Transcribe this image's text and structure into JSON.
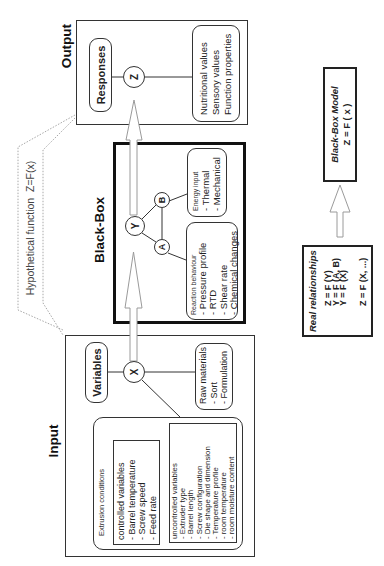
{
  "hypothetical_function": "Hypothetical function  Z=F(x)",
  "input": {
    "title": "Input",
    "variables_label": "Variables",
    "node": "X",
    "extrusion": {
      "title": "Extrusion conditions",
      "controlled": [
        "controlled variables",
        "- Barrel temperature",
        "- Screw speed",
        "- Feed rate"
      ],
      "uncontrolled": [
        "uncontrolled variables",
        "- Extruder type",
        "- Barrel length",
        "- Screw configuration",
        "- Die shape and dimension",
        "- Temperature profile",
        "- room temperature",
        "- room moisture content"
      ]
    },
    "raw_materials": [
      "Raw materials",
      "- Sort",
      "- Formulation"
    ]
  },
  "black_box": {
    "title": "Black-Box",
    "nodes": {
      "y": "Y",
      "a": "A",
      "b": "B"
    },
    "reaction": {
      "title": "Reaction behaviour",
      "items": [
        "- Pressure profile",
        "- RTD",
        "- Shear rate",
        "- Chemical changes"
      ]
    },
    "energy": {
      "title": "Energy input",
      "items": [
        "- Thermal",
        "- Mechanical"
      ]
    }
  },
  "output": {
    "title": "Output",
    "responses_label": "Responses",
    "node": "Z",
    "items": [
      "Nutritional values",
      "Sensory values",
      "Function properties"
    ]
  },
  "model": {
    "black_box_model": [
      "Black-Box Model",
      "Z = F ( x )"
    ],
    "real_relationships": {
      "title": "Real relationships",
      "equations": [
        "Z = F (Y)",
        "Y = F (A, B)",
        "Y = F (X)",
        "Z = F (X, ...)"
      ]
    }
  },
  "colors": {
    "line": "#333333",
    "arrow_outline": "#9a9a9a",
    "dotted": "#a8a8a8",
    "black_box_border": "#111111"
  }
}
